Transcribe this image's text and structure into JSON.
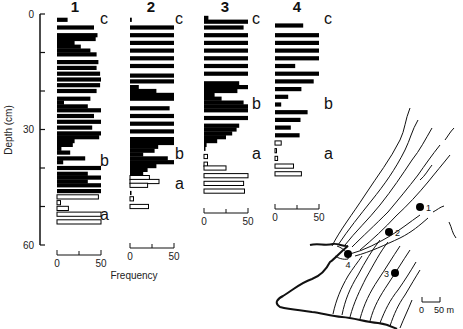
{
  "chart_data": {
    "type": "bar",
    "orientation": "horizontal",
    "title": "",
    "ylabel": "Depth (cm)",
    "xlabel": "Frequency",
    "ylim": [
      0,
      60
    ],
    "y_ticks": [
      0,
      10,
      20,
      30,
      40,
      50,
      60
    ],
    "y_tick_labels": [
      "0",
      "",
      "",
      "30",
      "",
      "",
      "60"
    ],
    "x_ticks": [
      0,
      25,
      50
    ],
    "x_tick_labels": [
      "0",
      "50"
    ],
    "xlim": [
      0,
      50
    ],
    "legend": "Filled bars = units b/c; open bars = unit a",
    "cores": [
      {
        "name": "1",
        "units": [
          {
            "label": "c",
            "depth": 1
          },
          {
            "label": "b",
            "depth": 38
          },
          {
            "label": "a",
            "depth": 52
          }
        ],
        "bars": [
          {
            "depth": 1.5,
            "value": 12,
            "filled": true
          },
          {
            "depth": 3.5,
            "value": 42,
            "filled": true
          },
          {
            "depth": 5.5,
            "value": 46,
            "filled": true
          },
          {
            "depth": 6.5,
            "value": 44,
            "filled": true
          },
          {
            "depth": 7.5,
            "value": 20,
            "filled": true
          },
          {
            "depth": 8.5,
            "value": 27,
            "filled": true
          },
          {
            "depth": 9.5,
            "value": 38,
            "filled": true
          },
          {
            "depth": 10.5,
            "value": 45,
            "filled": true
          },
          {
            "depth": 12.5,
            "value": 47,
            "filled": true
          },
          {
            "depth": 14,
            "value": 45,
            "filled": true
          },
          {
            "depth": 15.5,
            "value": 49,
            "filled": true
          },
          {
            "depth": 17,
            "value": 50,
            "filled": true
          },
          {
            "depth": 18.5,
            "value": 49,
            "filled": true
          },
          {
            "depth": 20,
            "value": 45,
            "filled": true
          },
          {
            "depth": 22,
            "value": 38,
            "filled": true
          },
          {
            "depth": 23,
            "value": 8,
            "filled": true
          },
          {
            "depth": 24,
            "value": 35,
            "filled": true
          },
          {
            "depth": 25,
            "value": 50,
            "filled": true
          },
          {
            "depth": 26.5,
            "value": 42,
            "filled": true
          },
          {
            "depth": 28,
            "value": 50,
            "filled": true
          },
          {
            "depth": 29.5,
            "value": 40,
            "filled": true
          },
          {
            "depth": 31,
            "value": 50,
            "filled": true
          },
          {
            "depth": 32,
            "value": 48,
            "filled": true
          },
          {
            "depth": 33,
            "value": 20,
            "filled": true
          },
          {
            "depth": 34,
            "value": 18,
            "filled": true
          },
          {
            "depth": 35,
            "value": 5,
            "filled": true
          },
          {
            "depth": 36,
            "value": 15,
            "filled": true
          },
          {
            "depth": 37.5,
            "value": 32,
            "filled": true
          },
          {
            "depth": 38.5,
            "value": 7,
            "filled": true
          },
          {
            "depth": 40,
            "value": 50,
            "filled": true
          },
          {
            "depth": 41.5,
            "value": 35,
            "filled": true
          },
          {
            "depth": 42.5,
            "value": 50,
            "filled": true
          },
          {
            "depth": 43.5,
            "value": 35,
            "filled": true
          },
          {
            "depth": 44.5,
            "value": 50,
            "filled": true
          },
          {
            "depth": 46,
            "value": 50,
            "filled": true
          },
          {
            "depth": 47.5,
            "value": 47,
            "filled": false
          },
          {
            "depth": 49,
            "value": 4,
            "filled": false
          },
          {
            "depth": 50.5,
            "value": 13,
            "filled": false
          },
          {
            "depth": 52,
            "value": 50,
            "filled": false
          },
          {
            "depth": 54,
            "value": 50,
            "filled": false
          }
        ]
      },
      {
        "name": "2",
        "units": [
          {
            "label": "c",
            "depth": 1
          },
          {
            "label": "b",
            "depth": 36
          },
          {
            "label": "a",
            "depth": 44
          }
        ],
        "bars": [
          {
            "depth": 1.5,
            "value": 2,
            "filled": true
          },
          {
            "depth": 3.5,
            "value": 50,
            "filled": true
          },
          {
            "depth": 5.5,
            "value": 50,
            "filled": true
          },
          {
            "depth": 7.5,
            "value": 50,
            "filled": true
          },
          {
            "depth": 9.5,
            "value": 50,
            "filled": true
          },
          {
            "depth": 11.5,
            "value": 50,
            "filled": true
          },
          {
            "depth": 13.5,
            "value": 50,
            "filled": true
          },
          {
            "depth": 16,
            "value": 50,
            "filled": true
          },
          {
            "depth": 17.5,
            "value": 50,
            "filled": true
          },
          {
            "depth": 19,
            "value": 10,
            "filled": true
          },
          {
            "depth": 20,
            "value": 30,
            "filled": true
          },
          {
            "depth": 21,
            "value": 50,
            "filled": true
          },
          {
            "depth": 22,
            "value": 50,
            "filled": true
          },
          {
            "depth": 24.5,
            "value": 45,
            "filled": true
          },
          {
            "depth": 26.5,
            "value": 50,
            "filled": true
          },
          {
            "depth": 28.5,
            "value": 50,
            "filled": true
          },
          {
            "depth": 30.5,
            "value": 50,
            "filled": true
          },
          {
            "depth": 32.5,
            "value": 50,
            "filled": true
          },
          {
            "depth": 33.5,
            "value": 50,
            "filled": true
          },
          {
            "depth": 34.5,
            "value": 32,
            "filled": true
          },
          {
            "depth": 35.5,
            "value": 28,
            "filled": true
          },
          {
            "depth": 36.5,
            "value": 15,
            "filled": true
          },
          {
            "depth": 37.5,
            "value": 43,
            "filled": true
          },
          {
            "depth": 38.5,
            "value": 50,
            "filled": true
          },
          {
            "depth": 39.5,
            "value": 30,
            "filled": true
          },
          {
            "depth": 40.5,
            "value": 20,
            "filled": true
          },
          {
            "depth": 41.5,
            "value": 15,
            "filled": true
          },
          {
            "depth": 42.5,
            "value": 22,
            "filled": false
          },
          {
            "depth": 43.5,
            "value": 33,
            "filled": false
          },
          {
            "depth": 44.5,
            "value": 20,
            "filled": false
          },
          {
            "depth": 46.5,
            "value": 1,
            "filled": true
          },
          {
            "depth": 48,
            "value": 4,
            "filled": false
          },
          {
            "depth": 50,
            "value": 21,
            "filled": false
          }
        ]
      },
      {
        "name": "3",
        "units": [
          {
            "label": "c",
            "depth": 1
          },
          {
            "label": "b",
            "depth": 23
          },
          {
            "label": "a",
            "depth": 36
          }
        ],
        "bars": [
          {
            "depth": 1,
            "value": 5,
            "filled": true
          },
          {
            "depth": 2,
            "value": 50,
            "filled": true
          },
          {
            "depth": 3.5,
            "value": 45,
            "filled": true
          },
          {
            "depth": 5.5,
            "value": 50,
            "filled": true
          },
          {
            "depth": 7.5,
            "value": 50,
            "filled": true
          },
          {
            "depth": 9.5,
            "value": 50,
            "filled": true
          },
          {
            "depth": 11.5,
            "value": 50,
            "filled": true
          },
          {
            "depth": 13.5,
            "value": 50,
            "filled": true
          },
          {
            "depth": 15.5,
            "value": 50,
            "filled": true
          },
          {
            "depth": 18,
            "value": 40,
            "filled": true
          },
          {
            "depth": 19,
            "value": 50,
            "filled": true
          },
          {
            "depth": 20,
            "value": 38,
            "filled": true
          },
          {
            "depth": 21,
            "value": 12,
            "filled": true
          },
          {
            "depth": 22,
            "value": 20,
            "filled": true
          },
          {
            "depth": 23,
            "value": 45,
            "filled": true
          },
          {
            "depth": 24,
            "value": 50,
            "filled": true
          },
          {
            "depth": 25,
            "value": 50,
            "filled": true
          },
          {
            "depth": 27,
            "value": 50,
            "filled": true
          },
          {
            "depth": 29,
            "value": 40,
            "filled": true
          },
          {
            "depth": 30,
            "value": 37,
            "filled": true
          },
          {
            "depth": 31,
            "value": 32,
            "filled": true
          },
          {
            "depth": 32,
            "value": 25,
            "filled": true
          },
          {
            "depth": 33,
            "value": 15,
            "filled": true
          },
          {
            "depth": 34,
            "value": 3,
            "filled": true
          },
          {
            "depth": 35,
            "value": 1,
            "filled": true
          },
          {
            "depth": 37,
            "value": 4,
            "filled": false
          },
          {
            "depth": 39,
            "value": 4,
            "filled": false
          },
          {
            "depth": 40,
            "value": 25,
            "filled": false
          },
          {
            "depth": 42,
            "value": 50,
            "filled": false
          },
          {
            "depth": 44,
            "value": 45,
            "filled": false
          },
          {
            "depth": 46,
            "value": 46,
            "filled": false
          }
        ]
      },
      {
        "name": "4",
        "units": [
          {
            "label": "c",
            "depth": 1
          },
          {
            "label": "b",
            "depth": 23
          },
          {
            "label": "a",
            "depth": 36
          }
        ],
        "bars": [
          {
            "depth": 3,
            "value": 32,
            "filled": true
          },
          {
            "depth": 5.5,
            "value": 50,
            "filled": true
          },
          {
            "depth": 7.5,
            "value": 50,
            "filled": true
          },
          {
            "depth": 9.5,
            "value": 50,
            "filled": true
          },
          {
            "depth": 11.5,
            "value": 50,
            "filled": true
          },
          {
            "depth": 13.5,
            "value": 23,
            "filled": true
          },
          {
            "depth": 15.5,
            "value": 50,
            "filled": true
          },
          {
            "depth": 17.5,
            "value": 44,
            "filled": true
          },
          {
            "depth": 19.5,
            "value": 30,
            "filled": true
          },
          {
            "depth": 21.5,
            "value": 15,
            "filled": true
          },
          {
            "depth": 23.5,
            "value": 7,
            "filled": true
          },
          {
            "depth": 25.5,
            "value": 37,
            "filled": true
          },
          {
            "depth": 27.5,
            "value": 29,
            "filled": true
          },
          {
            "depth": 29.5,
            "value": 18,
            "filled": true
          },
          {
            "depth": 31.5,
            "value": 28,
            "filled": true
          },
          {
            "depth": 33.5,
            "value": 7,
            "filled": false
          },
          {
            "depth": 35.5,
            "value": 1,
            "filled": false
          },
          {
            "depth": 37.5,
            "value": 3,
            "filled": false
          },
          {
            "depth": 39.5,
            "value": 21,
            "filled": false
          },
          {
            "depth": 41.5,
            "value": 30,
            "filled": false
          }
        ]
      }
    ],
    "map": {
      "sites": [
        {
          "label": "1",
          "x": 420,
          "y": 207
        },
        {
          "label": "2",
          "x": 389,
          "y": 232
        },
        {
          "label": "3",
          "x": 395,
          "y": 273
        },
        {
          "label": "4",
          "x": 348,
          "y": 254
        }
      ],
      "scale_bar": {
        "label_start": "0",
        "label_end": "50 m"
      }
    }
  },
  "labels": {
    "ylabel": "Depth (cm)",
    "xlabel": "Frequency",
    "y0": "0",
    "y30": "30",
    "y60": "60",
    "x0": "0",
    "x50": "50",
    "scale_start": "0",
    "scale_end": "50 m"
  }
}
